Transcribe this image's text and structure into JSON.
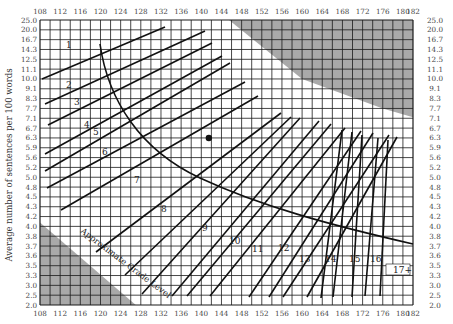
{
  "chart_data": {
    "type": "line",
    "title": "",
    "subtitle": "",
    "xlabel": "Average number of syllables per 100 words",
    "ylabel": "Average number of sentences per 100 words",
    "x_ticks": [
      108,
      112,
      116,
      120,
      124,
      128,
      132,
      136,
      140,
      144,
      148,
      152,
      156,
      160,
      164,
      168,
      172,
      176,
      180,
      182
    ],
    "y_ticks": [
      "25.0",
      "20.0",
      "16.7",
      "14.3",
      "12.5",
      "11.1",
      "10.0",
      "9.1",
      "8.3",
      "7.7",
      "7.1",
      "6.7",
      "6.3",
      "5.9",
      "5.6",
      "5.2",
      "5.0",
      "4.8",
      "4.5",
      "4.3",
      "4.2",
      "4.0",
      "3.8",
      "3.7",
      "3.6",
      "3.5",
      "3.3",
      "3.0",
      "2.5",
      "2.0"
    ],
    "xlim": [
      108,
      182
    ],
    "grid": true,
    "grade_labels": [
      "1",
      "2",
      "3",
      "4",
      "5",
      "6",
      "7",
      "8",
      "9",
      "10",
      "11",
      "12",
      "13",
      "14",
      "15",
      "16",
      "17+"
    ],
    "curve_label": "Approximate Grade Level",
    "shaded_regions": [
      "upper-right invalid region",
      "lower-left invalid region"
    ],
    "point": {
      "x": 141.5,
      "y": 6.3
    },
    "colors": {
      "grid": "#1a1a1a",
      "shade": "#a9a9a9",
      "line": "#111111"
    }
  }
}
